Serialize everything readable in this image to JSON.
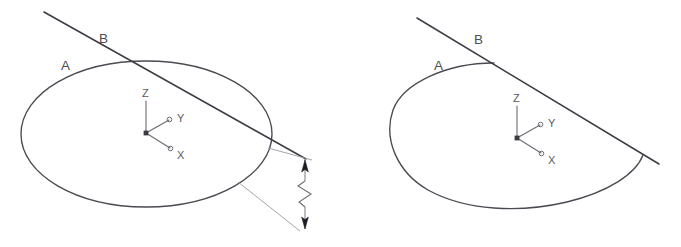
{
  "figure": {
    "background_color": "#ffffff",
    "line_color": "#4a4a52",
    "dimension_color": "#6e6e76",
    "axis_color": "#6b6b73",
    "panels": [
      {
        "id": "left-panel",
        "name": "uncut-circle-view",
        "shape_label": "A",
        "cut_line_label": "B",
        "shape_type": "full-ellipse",
        "axes": {
          "z_label": "Z",
          "y_label": "Y",
          "x_label": "X"
        },
        "dimension": {
          "name": "offset-dimension",
          "has_break_symbol": true,
          "value_text": ""
        }
      },
      {
        "id": "right-panel",
        "name": "trimmed-circle-view",
        "shape_label": "A",
        "cut_line_label": "B",
        "shape_type": "trimmed-ellipse",
        "axes": {
          "z_label": "Z",
          "y_label": "Y",
          "x_label": "X"
        }
      }
    ]
  }
}
